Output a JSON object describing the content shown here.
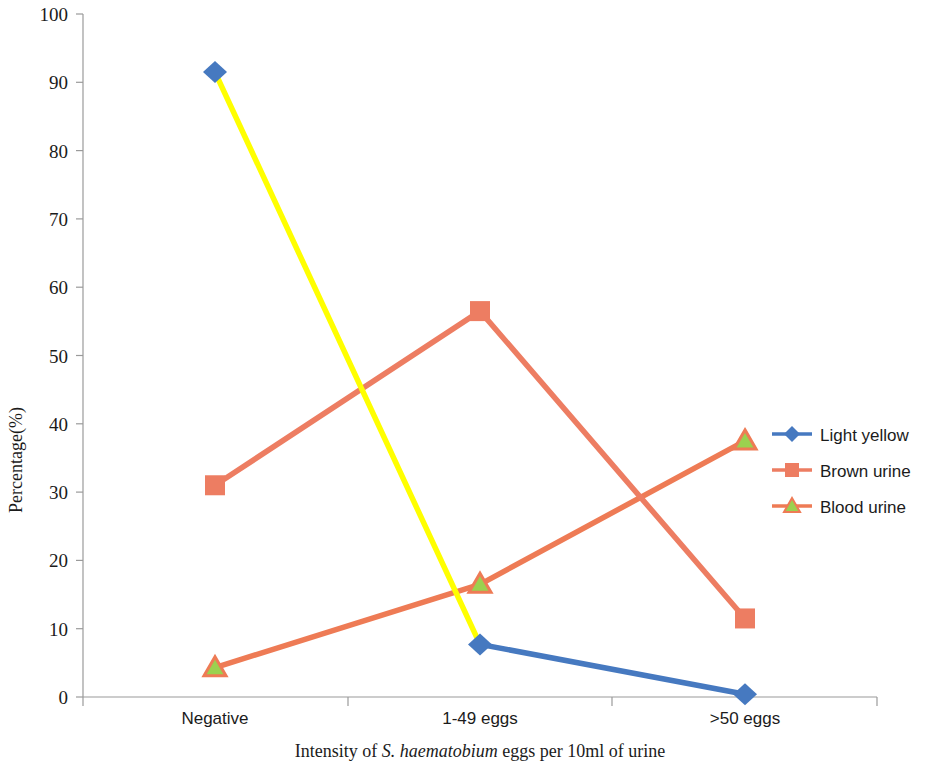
{
  "chart_data": {
    "type": "line",
    "title": "",
    "xlabel": "Intensity of S. haematobium eggs per 10ml of urine",
    "xlabel_parts": {
      "before": "Intensity of ",
      "italic": "S. haematobium",
      "after": " eggs per 10ml of urine"
    },
    "ylabel": "Percentage(%)",
    "categories": [
      "Negative",
      "1-49 eggs",
      ">50 eggs"
    ],
    "ylim": [
      0,
      100
    ],
    "yticks": [
      0,
      10,
      20,
      30,
      40,
      50,
      60,
      70,
      80,
      90,
      100
    ],
    "grid": false,
    "legend_position": "right",
    "series": [
      {
        "name": "Light yellow",
        "values": [
          91.5,
          7.7,
          0.4
        ],
        "marker": "diamond",
        "marker_color": "#4679c0",
        "line_colors": [
          "#ffff00",
          "#4679c0"
        ],
        "legend_line_color": "#4679c0"
      },
      {
        "name": "Brown urine",
        "values": [
          31.0,
          56.5,
          11.5
        ],
        "marker": "square",
        "marker_color": "#ed7d62",
        "line_colors": [
          "#ed7d62",
          "#ed7d62"
        ],
        "legend_line_color": "#ed7d62"
      },
      {
        "name": "Blood urine",
        "values": [
          4.3,
          16.5,
          37.5
        ],
        "marker": "triangle",
        "marker_color": "#9bd14f",
        "marker_stroke": "#ed7d62",
        "line_colors": [
          "#ee7b55",
          "#ee7b55"
        ],
        "legend_line_color": "#ee7b55"
      }
    ]
  },
  "yaxis": {
    "labels": [
      "100",
      "90",
      "80",
      "70",
      "60",
      "50",
      "40",
      "30",
      "20",
      "10",
      "0"
    ],
    "title": "Percentage(%)"
  },
  "xaxis": {
    "labels": [
      "Negative",
      "1-49 eggs",
      ">50 eggs"
    ],
    "title_before": "Intensity of ",
    "title_italic": "S. haematobium",
    "title_after": " eggs per 10ml of urine"
  },
  "legend": {
    "items": [
      {
        "label": "Light yellow"
      },
      {
        "label": "Brown urine"
      },
      {
        "label": "Blood urine"
      }
    ]
  },
  "colors": {
    "light_yellow_line": "#ffff00",
    "blue_line": "#4679c0",
    "brown_line": "#ed7d62",
    "blood_line": "#ee7b55",
    "green_marker": "#9bd14f",
    "axis": "#9a9a9a"
  }
}
